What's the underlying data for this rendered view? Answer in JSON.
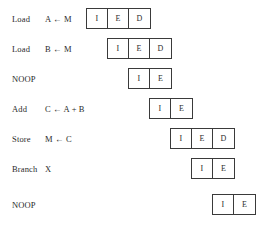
{
  "diagram": {
    "stage_cell_width": 21,
    "row_height": 22,
    "row_pitch": 30,
    "stage_offset_step": 21,
    "colors": {
      "background": "#ffffff",
      "text": "#2b2b2b",
      "box_border": "#3a3a3a"
    },
    "rows": [
      {
        "label": "Load",
        "operand": "A ← M",
        "top": 8,
        "stage_left": 86,
        "stages": [
          "I",
          "E",
          "D"
        ]
      },
      {
        "label": "Load",
        "operand": "B ← M",
        "top": 38,
        "stage_left": 107,
        "stages": [
          "I",
          "E",
          "D"
        ]
      },
      {
        "label": "NOOP",
        "operand": "",
        "top": 68,
        "stage_left": 128,
        "stages": [
          "I",
          "E"
        ]
      },
      {
        "label": "Add",
        "operand": "C ← A + B",
        "top": 98,
        "stage_left": 149,
        "stages": [
          "I",
          "E"
        ]
      },
      {
        "label": "Store",
        "operand": "M ← C",
        "top": 128,
        "stage_left": 170,
        "stages": [
          "I",
          "E",
          "D"
        ]
      },
      {
        "label": "Branch",
        "operand": "X",
        "top": 158,
        "stage_left": 191,
        "stages": [
          "I",
          "E"
        ]
      },
      {
        "label": "NOOP",
        "operand": "",
        "top": 194,
        "stage_left": 212,
        "stages": [
          "I",
          "E"
        ]
      }
    ]
  }
}
